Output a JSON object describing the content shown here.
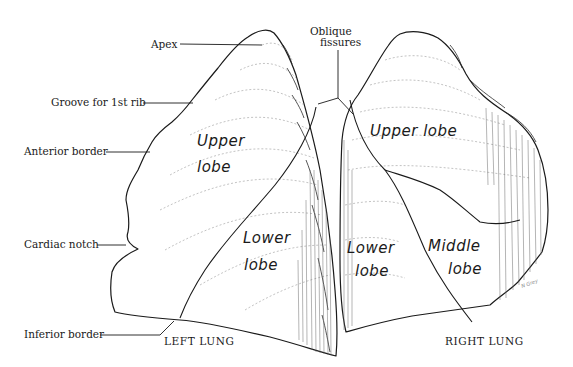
{
  "figure": {
    "left_lung": {
      "caption": "LEFT LUNG",
      "lobes": [
        {
          "line1": "Upper",
          "line2": "lobe"
        },
        {
          "line1": "Lower",
          "line2": "lobe"
        }
      ],
      "callouts": [
        {
          "id": "apex",
          "text": "Apex"
        },
        {
          "id": "groove-1st-rib",
          "text": "Groove for 1st rib"
        },
        {
          "id": "anterior-border",
          "text": "Anterior border"
        },
        {
          "id": "cardiac-notch",
          "text": "Cardiac notch"
        },
        {
          "id": "inferior-border",
          "text": "Inferior border"
        }
      ]
    },
    "right_lung": {
      "caption": "RIGHT LUNG",
      "lobes": [
        {
          "line1": "Upper lobe",
          "line2": ""
        },
        {
          "line1": "Lower",
          "line2": "lobe"
        },
        {
          "line1": "Middle",
          "line2": "lobe"
        }
      ]
    },
    "shared_callout": {
      "line1": "Oblique",
      "line2": "fissures"
    },
    "signature": "N Grey",
    "colors": {
      "ink": "#1a1a1a",
      "background": "#ffffff",
      "shading": "#9a9a9a"
    }
  }
}
